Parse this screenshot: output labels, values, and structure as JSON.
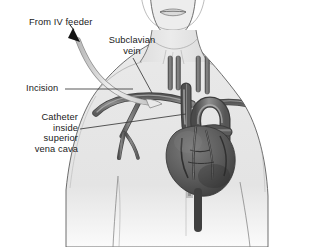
{
  "figure": {
    "type": "medical-illustration",
    "style": "grayscale anatomical drawing",
    "width": 329,
    "height": 247,
    "background_color": "#ffffff"
  },
  "labels": {
    "iv_feeder": "From IV feeder",
    "subclavian_vein": "Subclavian\nvein",
    "incision": "Incision",
    "catheter_svc": "Catheter\ninside\nsuperior\nvena cava"
  },
  "colors": {
    "skin_fill": "#e6e6e6",
    "skin_outline": "#4d4d4d",
    "vessel_dark": "#595959",
    "vessel_mid": "#7a7a7a",
    "vessel_light": "#a6a6a6",
    "heart_dark": "#4a4a4a",
    "heart_mid": "#6b6b6b",
    "tubing_fill": "#dcdcdc",
    "tubing_outline": "#8c8c8c",
    "arrow_fill": "#1a1a1a",
    "leader_line": "#3a3a3a",
    "text": "#1a1a1a"
  },
  "anatomy": {
    "parts": [
      "head and chin",
      "mouth",
      "neck",
      "sternocleidomastoid muscles",
      "clavicles",
      "upper torso and shoulders",
      "subclavian vein",
      "jugular veins",
      "superior vena cava",
      "aortic arch",
      "heart with coronary vessels",
      "inferior vena cava",
      "intravenous catheter tubing"
    ]
  }
}
